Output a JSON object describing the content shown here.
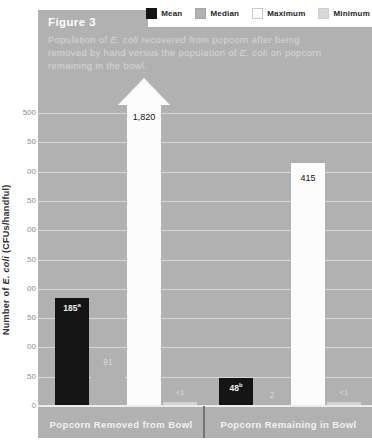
{
  "figure": {
    "label": "Figure 3",
    "caption_line1_pre": "Population of ",
    "caption_line1_italic": "E. coli",
    "caption_line1_post": " recovered from popcorn after being",
    "caption_line2_pre": "removed by hand versus the population of ",
    "caption_line2_italic": "E. coli",
    "caption_line2_post": " on popcorn",
    "caption_line3": "remaining in the bowl."
  },
  "legend": {
    "items": [
      {
        "label": "Mean",
        "color": "#141414",
        "border": "#141414"
      },
      {
        "label": "Median",
        "color": "#b1b1b1",
        "border": "#a5a5a5"
      },
      {
        "label": "Maximum",
        "color": "#ffffff",
        "border": "#c9c9c9"
      },
      {
        "label": "Minimum",
        "color": "#d8d8d8",
        "border": "#cfcfcf"
      }
    ]
  },
  "y_axis": {
    "title_pre": "Number of ",
    "title_italic": "E. coli",
    "title_post": " (CFUs/handful)",
    "tick_labels": [
      "500",
      "50",
      "00",
      "50",
      "00",
      "50",
      "00",
      "50",
      "00",
      "50",
      "0"
    ],
    "tick_values": [
      500,
      450,
      400,
      350,
      300,
      250,
      200,
      150,
      100,
      50,
      0
    ]
  },
  "x_axis": {
    "categories": [
      "Popcorn Removed from Bowl",
      "Popcorn Remaining in Bowl"
    ]
  },
  "chart_data": {
    "type": "bar",
    "title": "Figure 3",
    "subtitle": "Population of E. coli recovered from popcorn after being removed by hand versus the population of E. coli on popcorn remaining in the bowl.",
    "categories": [
      "Popcorn Removed from Bowl",
      "Popcorn Remaining in Bowl"
    ],
    "series": [
      {
        "name": "Mean",
        "values": [
          185,
          48
        ],
        "labels": [
          "185",
          "48"
        ],
        "label_sups": [
          "a",
          "b"
        ]
      },
      {
        "name": "Median",
        "values": [
          91,
          2
        ],
        "labels": [
          "91",
          "2"
        ],
        "label_sups": [
          "",
          ""
        ]
      },
      {
        "name": "Maximum",
        "values": [
          1820,
          415
        ],
        "labels": [
          "1,820",
          "415"
        ],
        "label_sups": [
          "",
          ""
        ],
        "off_scale": [
          true,
          false
        ]
      },
      {
        "name": "Minimum",
        "values": [
          0.5,
          0.5
        ],
        "labels": [
          "<1",
          "<1"
        ],
        "label_sups": [
          "",
          ""
        ]
      }
    ],
    "ylabel": "Number of E. coli (CFUs/handful)",
    "ylim": [
      0,
      500
    ],
    "grid": true,
    "legend_position": "top-right",
    "note": "Maximum bar for Popcorn Removed from Bowl (1,820) exceeds the axis and is drawn as an upward arrow."
  },
  "colors": {
    "panel": "#b1b1b1",
    "mean_bar": "#141414",
    "median_bar": "#b1b1b1",
    "maximum_bar": "#fcfcfc",
    "minimum_bar": "#d4d4d4",
    "mean_label": "#ededed",
    "maximum_label": "#111111",
    "small_label": "#d8d8d8",
    "divider": "#747474"
  }
}
